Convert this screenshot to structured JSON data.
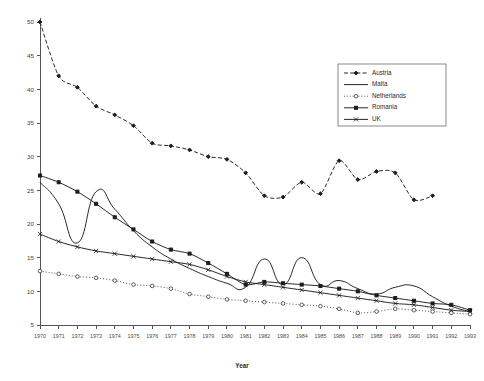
{
  "chart_data": {
    "type": "line",
    "title": "",
    "xlabel": "Year",
    "ylabel": "",
    "xlim": [
      1970,
      1993
    ],
    "ylim": [
      5,
      50
    ],
    "grid": false,
    "legend_position": "top-right",
    "categories": [
      1970,
      1971,
      1972,
      1973,
      1974,
      1975,
      1976,
      1977,
      1978,
      1979,
      1980,
      1981,
      1982,
      1983,
      1984,
      1985,
      1986,
      1987,
      1988,
      1989,
      1990,
      1991,
      1992,
      1993
    ],
    "xtick_labels": [
      "1970",
      "1971",
      "1972",
      "1973",
      "1974",
      "1975",
      "1976",
      "1977",
      "1978",
      "1979",
      "1980",
      "1981",
      "1982",
      "1983",
      "1984",
      "1985",
      "1986",
      "1987",
      "1988",
      "1989",
      "1990",
      "1991",
      "1992",
      "1993"
    ],
    "ytick_labels": [
      "5",
      "10",
      "15",
      "20",
      "25",
      "30",
      "35",
      "40",
      "45",
      "50"
    ],
    "ytick_values": [
      5,
      10,
      15,
      20,
      25,
      30,
      35,
      40,
      45,
      50
    ],
    "series": [
      {
        "name": "Austria",
        "style": "dashed",
        "marker": "diamond",
        "values": [
          50.0,
          42.0,
          40.3,
          37.5,
          36.2,
          34.6,
          32.0,
          31.6,
          31.0,
          30.0,
          29.6,
          27.6,
          24.2,
          24.0,
          26.2,
          24.5,
          29.4,
          26.6,
          27.8,
          27.6,
          23.6,
          24.2,
          null,
          null
        ]
      },
      {
        "name": "Malta",
        "style": "solid",
        "marker": "none",
        "values": [
          26.2,
          23.0,
          17.2,
          24.8,
          22.2,
          19.0,
          16.6,
          14.8,
          13.4,
          12.2,
          11.2,
          10.6,
          14.8,
          11.0,
          15.0,
          11.0,
          11.6,
          10.4,
          9.6,
          10.6,
          10.8,
          9.2,
          7.8,
          7.0
        ]
      },
      {
        "name": "Netherlands",
        "style": "dotted",
        "marker": "circle",
        "values": [
          13.0,
          12.6,
          12.2,
          12.0,
          11.6,
          11.0,
          10.8,
          10.4,
          9.6,
          9.2,
          8.8,
          8.6,
          8.4,
          8.2,
          8.0,
          7.8,
          7.4,
          6.8,
          7.0,
          7.4,
          7.2,
          7.0,
          6.8,
          6.6
        ]
      },
      {
        "name": "Romania",
        "style": "solid",
        "marker": "filled",
        "values": [
          27.2,
          26.2,
          24.8,
          23.0,
          21.0,
          19.2,
          17.4,
          16.2,
          15.6,
          14.2,
          12.6,
          11.0,
          11.4,
          11.2,
          11.0,
          10.8,
          10.4,
          10.0,
          9.4,
          9.0,
          8.6,
          8.2,
          8.0,
          7.2
        ]
      },
      {
        "name": "UK",
        "style": "solid",
        "marker": "cross",
        "values": [
          18.5,
          17.4,
          16.6,
          16.0,
          15.6,
          15.2,
          14.8,
          14.4,
          14.0,
          13.2,
          12.2,
          11.4,
          11.0,
          10.6,
          10.2,
          9.8,
          9.4,
          9.0,
          8.6,
          8.2,
          8.0,
          7.6,
          7.2,
          7.0
        ]
      }
    ]
  },
  "legend": {
    "items": [
      {
        "label": "Austria"
      },
      {
        "label": "Malta"
      },
      {
        "label": "Netherlands"
      },
      {
        "label": "Romania"
      },
      {
        "label": "UK"
      }
    ]
  }
}
